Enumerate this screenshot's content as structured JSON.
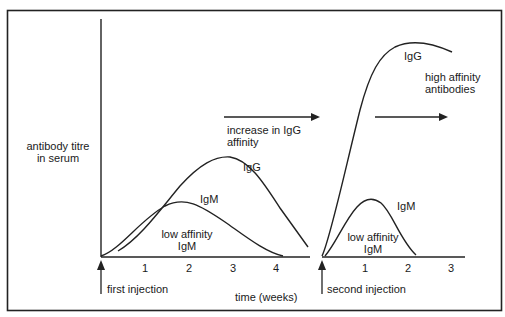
{
  "diagram": {
    "y_axis_label_line1": "antibody titre",
    "y_axis_label_line2": "in serum",
    "x_axis_label": "time (weeks)",
    "first_injection_label": "first injection",
    "second_injection_label": "second injection",
    "primary_ticks": [
      "1",
      "2",
      "3",
      "4"
    ],
    "secondary_ticks": [
      "1",
      "2",
      "3"
    ],
    "primary_igg_label": "IgG",
    "primary_igm_label": "IgM",
    "primary_low_affinity_line1": "low affinity",
    "primary_low_affinity_line2": "IgM",
    "increase_line1": "increase in IgG",
    "increase_line2": "affinity",
    "secondary_igg_label": "IgG",
    "high_affinity_line1": "high affinity",
    "high_affinity_line2": "antibodies",
    "secondary_igm_label": "IgM",
    "secondary_low_affinity_line1": "low affinity",
    "secondary_low_affinity_line2": "IgM",
    "line_color": "#1a1a1a"
  }
}
